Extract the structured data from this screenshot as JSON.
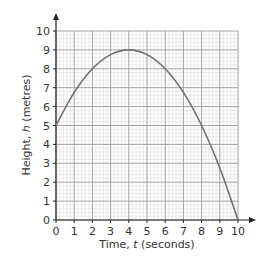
{
  "chart_data": {
    "type": "line",
    "title": "",
    "xlabel": "Time, t (seconds)",
    "ylabel": "Height, h (metres)",
    "xlabel_parts": {
      "pre": "Time, ",
      "var": "t",
      "post": " (seconds)"
    },
    "ylabel_parts": {
      "pre": "Height, ",
      "var": "h",
      "post": " (metres)"
    },
    "xlim": [
      0,
      10
    ],
    "ylim": [
      0,
      10
    ],
    "x_ticks": [
      "0",
      "1",
      "2",
      "3",
      "4",
      "5",
      "6",
      "7",
      "8",
      "9",
      "10"
    ],
    "y_ticks": [
      "0",
      "1",
      "2",
      "3",
      "4",
      "5",
      "6",
      "7",
      "8",
      "9",
      "10"
    ],
    "grid": {
      "major": 1,
      "minor": 0.2
    },
    "legend": null,
    "series": [
      {
        "name": "h",
        "x": [
          0,
          1,
          2,
          3,
          4,
          5,
          6,
          7,
          8,
          9,
          10
        ],
        "values": [
          5,
          6.75,
          8,
          8.75,
          9,
          8.75,
          8,
          6.75,
          5,
          2.75,
          0
        ]
      }
    ],
    "colors": {
      "curve": "#707070",
      "major_grid": "#9a9a9a",
      "minor_grid": "#d6d6d6",
      "axis": "#222222"
    }
  }
}
